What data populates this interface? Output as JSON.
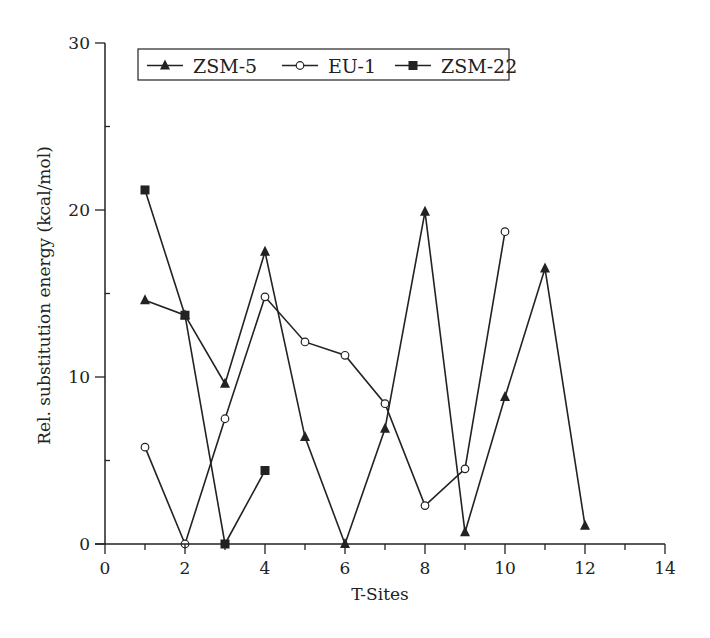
{
  "chart_data": {
    "type": "line",
    "title": "",
    "xlabel": "T-Sites",
    "ylabel": "Rel. substitution energy (kcal/mol)",
    "xlim": [
      0,
      14
    ],
    "ylim": [
      0,
      30
    ],
    "x_ticks": [
      0,
      2,
      4,
      6,
      8,
      10,
      12,
      14
    ],
    "x_minor_step": 1,
    "y_ticks": [
      0,
      10,
      20,
      30
    ],
    "y_minor_step": 5,
    "grid": false,
    "legend_position": "top-left",
    "line_color": "#222222",
    "series": [
      {
        "name": "ZSM-5",
        "marker": "triangle-filled",
        "x": [
          1,
          2,
          3,
          4,
          5,
          6,
          7,
          8,
          9,
          10,
          11,
          12
        ],
        "y": [
          14.6,
          13.7,
          9.6,
          17.5,
          6.4,
          0.0,
          6.9,
          19.9,
          0.7,
          8.8,
          16.5,
          1.1
        ]
      },
      {
        "name": "EU-1",
        "marker": "circle-open",
        "x": [
          1,
          2,
          3,
          4,
          5,
          6,
          7,
          8,
          9,
          10
        ],
        "y": [
          5.8,
          0.0,
          7.5,
          14.8,
          12.1,
          11.3,
          8.4,
          2.3,
          4.5,
          18.7
        ]
      },
      {
        "name": "ZSM-22",
        "marker": "square-filled",
        "x": [
          1,
          2,
          3,
          4
        ],
        "y": [
          21.2,
          13.7,
          0.0,
          4.4
        ]
      }
    ]
  }
}
